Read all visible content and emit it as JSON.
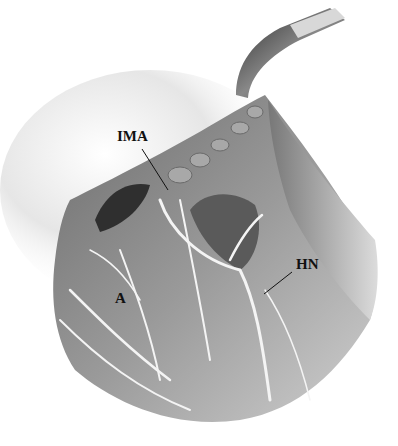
{
  "figure": {
    "labels": {
      "ima": "IMA",
      "hn": "HN",
      "a": "A"
    }
  }
}
